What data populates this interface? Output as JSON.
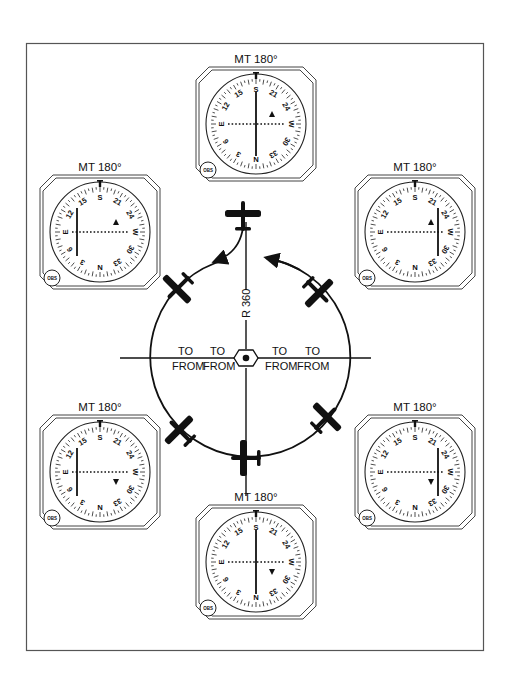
{
  "diagram": {
    "type": "VOR orientation diagram",
    "colors": {
      "ink": "#111111",
      "frame": "#555555",
      "background": "#ffffff"
    },
    "station": {
      "symbol": "vor-hexagon",
      "x": 246,
      "y": 358
    },
    "radial_label": "R 360",
    "to_from_flags": [
      {
        "to": "TO",
        "from": "FROM",
        "x": 185
      },
      {
        "to": "TO",
        "from": "FROM",
        "x": 218
      },
      {
        "to": "TO",
        "from": "FROM",
        "x": 280
      },
      {
        "to": "TO",
        "from": "FROM",
        "x": 311
      }
    ],
    "instruments": [
      {
        "id": "top",
        "caption": "MT 180°",
        "cx": 256,
        "cy": 124,
        "needle": "center",
        "flag": "TO"
      },
      {
        "id": "upper-left",
        "caption": "MT 180°",
        "cx": 100,
        "cy": 232,
        "needle": "left",
        "flag": "TO"
      },
      {
        "id": "upper-right",
        "caption": "MT 180°",
        "cx": 415,
        "cy": 232,
        "needle": "right",
        "flag": "TO"
      },
      {
        "id": "lower-left",
        "caption": "MT 180°",
        "cx": 100,
        "cy": 472,
        "needle": "left",
        "flag": "FROM"
      },
      {
        "id": "lower-right",
        "caption": "MT 180°",
        "cx": 415,
        "cy": 472,
        "needle": "right",
        "flag": "FROM"
      },
      {
        "id": "bottom",
        "caption": "MT 180°",
        "cx": 256,
        "cy": 562,
        "needle": "center",
        "flag": "FROM"
      }
    ],
    "dial_labels": [
      "S",
      "21",
      "24",
      "W",
      "30",
      "33",
      "N",
      "3",
      "6",
      "E",
      "12",
      "15"
    ],
    "obs_label": "OBS",
    "aircraft": [
      {
        "position": "top",
        "x": 243,
        "y": 215,
        "heading": 0
      },
      {
        "position": "upper-left",
        "x": 176,
        "y": 287,
        "heading": 225
      },
      {
        "position": "upper-right",
        "x": 320,
        "y": 290,
        "heading": 135
      },
      {
        "position": "lower-left",
        "x": 180,
        "y": 431,
        "heading": 315
      },
      {
        "position": "lower-right",
        "x": 326,
        "y": 420,
        "heading": 45
      },
      {
        "position": "bottom",
        "x": 245,
        "y": 458,
        "heading": 270
      }
    ]
  }
}
